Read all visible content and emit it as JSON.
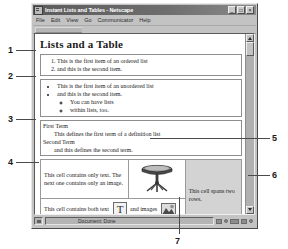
{
  "figure": {
    "callouts": [
      {
        "number": "1",
        "target": "ordered-list"
      },
      {
        "number": "2",
        "target": "unordered-list"
      },
      {
        "number": "3",
        "target": "definition-list"
      },
      {
        "number": "4",
        "target": "table-text-cell"
      },
      {
        "number": "5",
        "target": "table-image-cell"
      },
      {
        "number": "6",
        "target": "table-rowspan-cell"
      },
      {
        "number": "7",
        "target": "status-bar"
      }
    ]
  },
  "window": {
    "title": "Instant Lists and Tables - Netscape",
    "icon": "netscape-document-icon",
    "controls": [
      {
        "name": "minimize",
        "glyph": "_"
      },
      {
        "name": "maximize",
        "glyph": "□"
      },
      {
        "name": "close",
        "glyph": "×"
      }
    ]
  },
  "menubar": {
    "items": [
      {
        "label": "File"
      },
      {
        "label": "Edit"
      },
      {
        "label": "View"
      },
      {
        "label": "Go"
      },
      {
        "label": "Communicator"
      },
      {
        "label": "Help"
      }
    ]
  },
  "page": {
    "heading": "Lists and a Table",
    "ordered_list": [
      "This is the first item of an ordered list",
      "and this is the second item."
    ],
    "unordered_list": [
      "This is the first item of an unordered list",
      "and this is the second item."
    ],
    "nested_list": [
      "You can have lists",
      "within lists, too."
    ],
    "definition_list": [
      {
        "term": "First Term",
        "definition": "This defines the first term of a definition list"
      },
      {
        "term": "Second Term",
        "definition": "and this defines the second term."
      }
    ],
    "table": {
      "row1": {
        "text_cell": "This cell contains only text. The next one contains only an image.",
        "image_cell_alt": "pedestal-table-illustration",
        "rowspan_cell": "This cell spans two rows."
      },
      "row2": {
        "text_before": "This cell contains both text",
        "image1_alt": "letter-t-image",
        "text_middle": "and images",
        "image2_alt": "photo-thumbnail-image",
        "text_after": "It spans two columns."
      }
    }
  },
  "scrollbar": {
    "up_arrow": "scroll-up",
    "down_arrow": "scroll-down"
  },
  "statusbar": {
    "message": "Document: Done",
    "lock_icon": "security-lock-icon",
    "tray_icons": [
      "mail-icon",
      "newsgroup-icon",
      "composer-icon",
      "conference-icon"
    ]
  },
  "colors": {
    "window_chrome": "#c3c3c3",
    "titlebar": "#6e6e6e",
    "page_background": "#ffffff",
    "spanned_cell_background": "#d3d3d3",
    "callout_line": "#4a4a4a"
  }
}
